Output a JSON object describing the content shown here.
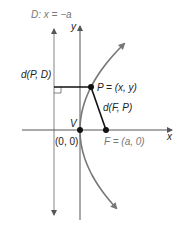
{
  "diagram": {
    "directrix_label": "D: x = −a",
    "y_axis_label": "y",
    "x_axis_label": "x",
    "distance_to_directrix_label": "d(P, D)",
    "point_label": "P = (x, y)",
    "distance_to_focus_label": "d(F, P)",
    "vertex_label": "V",
    "vertex_coords_label": "(0, 0)",
    "focus_label": "F = (a, 0)",
    "colors": {
      "curve": "#777777",
      "segment": "#111111",
      "axis": "#555555",
      "focus_label": "#777777"
    }
  }
}
